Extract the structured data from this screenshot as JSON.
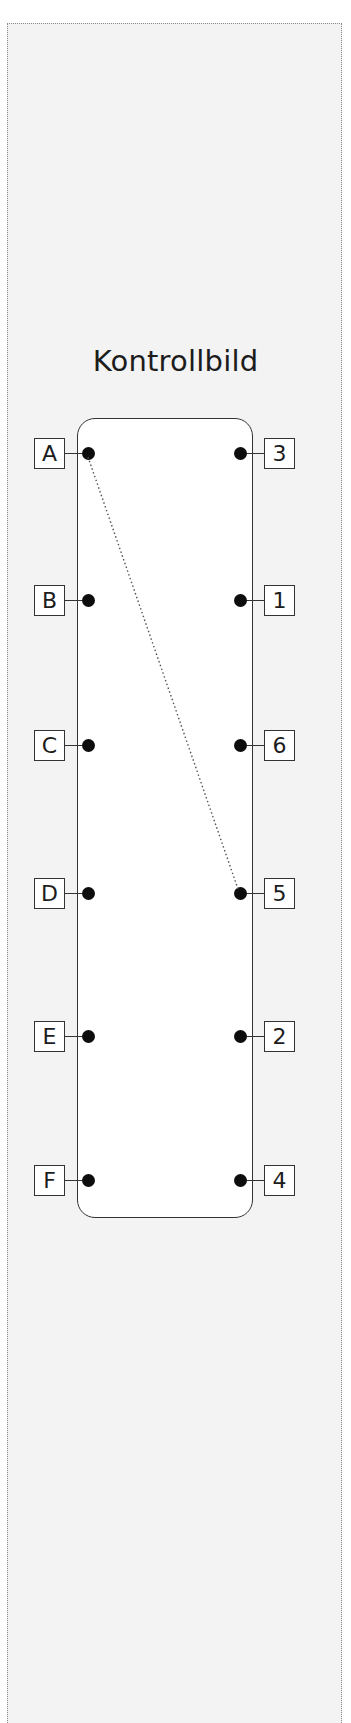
{
  "title": "Kontrollbild",
  "left_terminals": [
    {
      "label": "A",
      "y": 453
    },
    {
      "label": "B",
      "y": 600
    },
    {
      "label": "C",
      "y": 745
    },
    {
      "label": "D",
      "y": 893
    },
    {
      "label": "E",
      "y": 1036
    },
    {
      "label": "F",
      "y": 1180
    }
  ],
  "right_terminals": [
    {
      "label": "3",
      "y": 453
    },
    {
      "label": "1",
      "y": 600
    },
    {
      "label": "6",
      "y": 745
    },
    {
      "label": "5",
      "y": 893
    },
    {
      "label": "2",
      "y": 1036
    },
    {
      "label": "4",
      "y": 1180
    }
  ],
  "connections": [
    {
      "from": "A",
      "to": "5",
      "style": "dotted"
    }
  ],
  "colors": {
    "line": "#333333",
    "dot": "#0d0d0d",
    "background": "#f3f3f3",
    "panel": "#ffffff"
  }
}
